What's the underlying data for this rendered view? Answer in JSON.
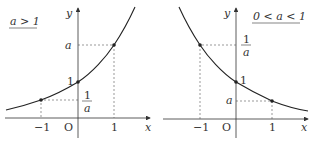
{
  "graphs": [
    {
      "condition": "a > 1",
      "axis_x": "x",
      "axis_y": "y",
      "origin": "O",
      "tick_neg": "−1",
      "tick_pos": "1",
      "y_one": "1",
      "y_a": "a",
      "frac_num": "1",
      "frac_den": "a"
    },
    {
      "condition": "0 < a < 1",
      "axis_x": "x",
      "axis_y": "y",
      "origin": "O",
      "tick_neg": "−1",
      "tick_pos": "1",
      "y_one": "1",
      "y_a": "a",
      "frac_num": "1",
      "frac_den": "a"
    }
  ],
  "colors": {
    "curve": "#222222",
    "axis": "#333333",
    "dashed": "#555555"
  }
}
